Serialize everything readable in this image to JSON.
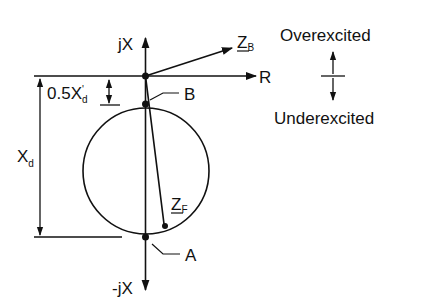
{
  "diagram": {
    "type": "impedance-plane-loss-of-excitation",
    "axes": {
      "vertical_positive": "jX",
      "vertical_negative": "-jX",
      "horizontal": "R"
    },
    "dimensions": {
      "offset_main": "0.5X",
      "offset_prime": "'",
      "offset_sub": "d",
      "diameter_main": "X",
      "diameter_sub": "d"
    },
    "points": {
      "top": "B",
      "bottom": "A"
    },
    "vectors": {
      "zb_main": "Z",
      "zb_sub": "B",
      "zf_main": "Z",
      "zf_sub": "F"
    },
    "legend": {
      "upper": "Overexcited",
      "lower": "Underexcited"
    },
    "colors": {
      "ink": "#111111",
      "background": "#ffffff"
    }
  }
}
